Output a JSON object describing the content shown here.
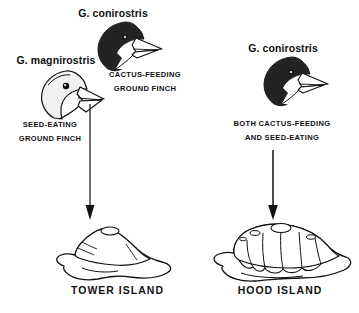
{
  "figure": {
    "background_color": "#ffffff",
    "ink_color": "#111111",
    "type": "scientific-diagram"
  },
  "columns": [
    {
      "id": "tower",
      "island_label": "TOWER ISLAND",
      "birds": [
        {
          "id": "magnirostris",
          "species_label": "G. magnirostris",
          "caption_line1": "SEED-EATING",
          "caption_line2": "GROUND FINCH",
          "plumage_color": "#f0f0f0",
          "outline_color": "#111111",
          "beak_type": "deep-thick"
        },
        {
          "id": "conirostris-tower",
          "species_label": "G. conirostris",
          "caption_line1": "CACTUS-FEEDING",
          "caption_line2": "GROUND FINCH",
          "plumage_color": "#232323",
          "outline_color": "#111111",
          "beak_type": "long-pointed"
        }
      ]
    },
    {
      "id": "hood",
      "island_label": "HOOD ISLAND",
      "birds": [
        {
          "id": "conirostris-hood",
          "species_label": "G. conirostris",
          "caption_line1": "BOTH CACTUS-FEEDING",
          "caption_line2": "AND SEED-EATING",
          "plumage_color": "#232323",
          "outline_color": "#111111",
          "beak_type": "long-pointed"
        }
      ]
    }
  ],
  "arrows": {
    "left": {
      "name": "arrow-down-tower",
      "direction": "down"
    },
    "right": {
      "name": "arrow-down-hood",
      "direction": "down"
    }
  }
}
